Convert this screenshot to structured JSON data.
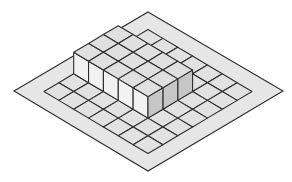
{
  "diagram": {
    "type": "isometric-grid",
    "grid_size": 7,
    "origin": [
      148,
      29.5
    ],
    "cell_u": [
      14.86,
      8.86
    ],
    "cell_v": [
      -14.86,
      8.86
    ],
    "border_outer": [
      [
        148,
        12
      ],
      [
        283,
        91
      ],
      [
        148,
        171
      ],
      [
        14,
        91
      ]
    ],
    "block": {
      "i_range": [
        0,
        5
      ],
      "j_range": [
        2,
        5
      ],
      "height_px": 21.5
    },
    "colors": {
      "background": "#ffffff",
      "border_fill": "#e6e6e6",
      "cell_fill": "#e2e2e2",
      "top_fill": "#e0e0e0",
      "left_face": "#f2f2f2",
      "right_face": "#c6c6c6",
      "line": "#2e2e2e"
    }
  }
}
